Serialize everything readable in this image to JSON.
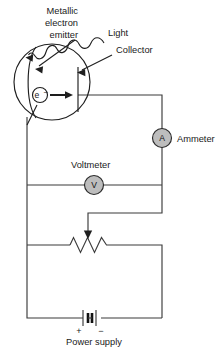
{
  "figure": {
    "width": 224,
    "height": 348,
    "background_color": "#ffffff",
    "line_color": "#3b3b3b",
    "meter_fill_color": "#bdbdbd"
  },
  "labels": {
    "emitter_line1": "Metallic",
    "emitter_line2": "electron",
    "emitter_line3": "emitter",
    "light": "Light",
    "collector": "Collector",
    "ammeter": "Ammeter",
    "voltmeter": "Voltmeter",
    "power_supply": "Power supply",
    "electron": "e",
    "electron_charge": "−",
    "plus_sign": "+",
    "minus_sign": "−"
  },
  "components": {
    "ammeter_symbol": "A",
    "voltmeter_symbol": "V",
    "vacuum_tube": "phototube",
    "resistor": "variable-resistor",
    "battery": "two-cell-battery"
  }
}
